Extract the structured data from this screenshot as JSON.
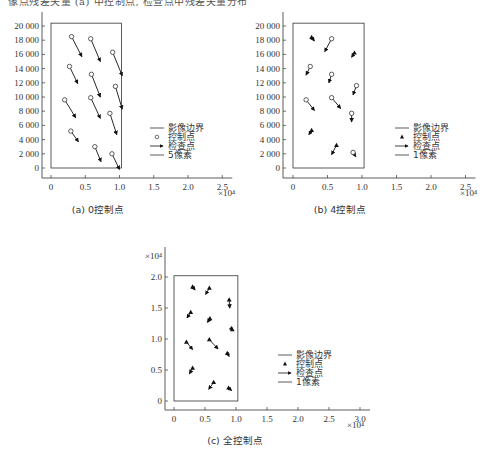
{
  "header_fragment": "像点残差矢量 (a) 中控制点, 检查点中残差矢量分布",
  "charts": [
    {
      "caption": "(a) 0控制点",
      "y_ticks": [
        "20 000",
        "18 000",
        "16 000",
        "14 000",
        "12 000",
        "10 000",
        "8 000",
        "6 000",
        "4 000",
        "2 000",
        "0"
      ],
      "x_ticks": [
        "0",
        "0.5",
        "1.0",
        "1.5",
        "2.0",
        "2.5"
      ],
      "x_scale_label": "×10⁴",
      "legend": [
        "影像边界",
        "控制点",
        "检查点",
        "5像素"
      ]
    },
    {
      "caption": "(b) 4控制点",
      "y_ticks": [
        "20 000",
        "18 000",
        "16 000",
        "14 000",
        "12 000",
        "10 000",
        "8 000",
        "6 000",
        "4 000",
        "2 000",
        "0"
      ],
      "x_ticks": [
        "0",
        "0.5",
        "1.0",
        "1.5",
        "2.0",
        "2.5"
      ],
      "x_scale_label": "×10⁴",
      "legend": [
        "影像边界",
        "控制点",
        "检查点",
        "1像素"
      ]
    },
    {
      "caption": "(c) 全控制点",
      "y_scale_label": "×10⁴",
      "y_ticks": [
        "2.0",
        "1.5",
        "1.0",
        "0.5",
        "0"
      ],
      "x_ticks": [
        "0",
        "0.5",
        "1.0",
        "1.5",
        "2.0",
        "2.5",
        "3.0"
      ],
      "x_scale_label": "×10⁴",
      "legend": [
        "影像边界",
        "控制点",
        "检查点",
        "1像素"
      ]
    }
  ],
  "chart_data": [
    {
      "type": "scatter",
      "title": "(a) 0控制点",
      "xlabel": "×10⁴",
      "ylabel": "",
      "xlim": [
        0,
        2.7
      ],
      "ylim": [
        0,
        20000
      ],
      "image_boundary": {
        "x": [
          0,
          1.03
        ],
        "y": [
          0,
          20400
        ]
      },
      "legend": [
        "影像边界",
        "控制点",
        "检查点",
        "5像素"
      ],
      "points": [
        {
          "x": 0.3,
          "y": 18500,
          "dx": 0.15,
          "dy": -2800,
          "kind": "check"
        },
        {
          "x": 0.58,
          "y": 18200,
          "dx": 0.14,
          "dy": -3200,
          "kind": "check"
        },
        {
          "x": 0.9,
          "y": 16300,
          "dx": 0.14,
          "dy": -3300,
          "kind": "check"
        },
        {
          "x": 0.27,
          "y": 14300,
          "dx": 0.12,
          "dy": -2400,
          "kind": "check"
        },
        {
          "x": 0.59,
          "y": 13200,
          "dx": 0.13,
          "dy": -3200,
          "kind": "check"
        },
        {
          "x": 0.94,
          "y": 11500,
          "dx": 0.1,
          "dy": -3200,
          "kind": "check"
        },
        {
          "x": 0.2,
          "y": 9600,
          "dx": 0.16,
          "dy": -2500,
          "kind": "check"
        },
        {
          "x": 0.58,
          "y": 9900,
          "dx": 0.14,
          "dy": -2900,
          "kind": "check"
        },
        {
          "x": 0.86,
          "y": 7700,
          "dx": 0.1,
          "dy": -3000,
          "kind": "check"
        },
        {
          "x": 0.29,
          "y": 5200,
          "dx": 0.11,
          "dy": -1500,
          "kind": "check"
        },
        {
          "x": 0.64,
          "y": 3000,
          "dx": 0.09,
          "dy": -2100,
          "kind": "check"
        },
        {
          "x": 0.89,
          "y": 2000,
          "dx": 0.11,
          "dy": -2200,
          "kind": "check"
        }
      ]
    },
    {
      "type": "scatter",
      "title": "(b) 4控制点",
      "xlabel": "×10⁴",
      "ylabel": "",
      "xlim": [
        0,
        2.7
      ],
      "ylim": [
        0,
        20000
      ],
      "image_boundary": {
        "x": [
          0,
          1.03
        ],
        "y": [
          0,
          20400
        ]
      },
      "legend": [
        "影像边界",
        "控制点",
        "检查点",
        "1像素"
      ],
      "control_points": [
        {
          "x": 0.27,
          "y": 18400
        },
        {
          "x": 0.89,
          "y": 16200
        },
        {
          "x": 0.27,
          "y": 5300
        },
        {
          "x": 0.63,
          "y": 3200
        }
      ],
      "points": [
        {
          "x": 0.27,
          "y": 18400,
          "dx": 0.04,
          "dy": -500,
          "kind": "control"
        },
        {
          "x": 0.56,
          "y": 18200,
          "dx": -0.1,
          "dy": -1800,
          "kind": "check"
        },
        {
          "x": 0.89,
          "y": 16200,
          "dx": -0.04,
          "dy": -600,
          "kind": "control"
        },
        {
          "x": 0.25,
          "y": 14300,
          "dx": -0.06,
          "dy": -1200,
          "kind": "check"
        },
        {
          "x": 0.56,
          "y": 13200,
          "dx": -0.04,
          "dy": -1200,
          "kind": "check"
        },
        {
          "x": 0.92,
          "y": 11600,
          "dx": -0.05,
          "dy": -1300,
          "kind": "check"
        },
        {
          "x": 0.19,
          "y": 9600,
          "dx": 0.12,
          "dy": -1500,
          "kind": "check"
        },
        {
          "x": 0.56,
          "y": 9900,
          "dx": 0.13,
          "dy": -1500,
          "kind": "check"
        },
        {
          "x": 0.85,
          "y": 7700,
          "dx": 0.0,
          "dy": -1200,
          "kind": "check"
        },
        {
          "x": 0.27,
          "y": 5300,
          "dx": -0.04,
          "dy": -600,
          "kind": "control"
        },
        {
          "x": 0.63,
          "y": 3200,
          "dx": -0.07,
          "dy": -1300,
          "kind": "control"
        },
        {
          "x": 0.87,
          "y": 2200,
          "dx": 0.04,
          "dy": -600,
          "kind": "check"
        }
      ]
    },
    {
      "type": "scatter",
      "title": "(c) 全控制点",
      "xlabel": "×10⁴",
      "ylabel": "×10⁴",
      "xlim": [
        0,
        3.0
      ],
      "ylim": [
        0,
        2.0
      ],
      "image_boundary": {
        "x": [
          0,
          1.03
        ],
        "y": [
          0,
          2.02
        ]
      },
      "legend": [
        "影像边界",
        "控制点",
        "检查点",
        "1像素"
      ],
      "points": [
        {
          "x": 0.3,
          "y": 1.84,
          "dx": 0.04,
          "dy": -0.05,
          "kind": "control"
        },
        {
          "x": 0.57,
          "y": 1.82,
          "dx": -0.06,
          "dy": -0.1,
          "kind": "control"
        },
        {
          "x": 0.89,
          "y": 1.63,
          "dx": 0.01,
          "dy": -0.13,
          "kind": "control"
        },
        {
          "x": 0.27,
          "y": 1.43,
          "dx": -0.06,
          "dy": -0.09,
          "kind": "control"
        },
        {
          "x": 0.58,
          "y": 1.33,
          "dx": -0.04,
          "dy": -0.06,
          "kind": "control"
        },
        {
          "x": 0.94,
          "y": 1.15,
          "dx": 0.01,
          "dy": -0.01,
          "kind": "control"
        },
        {
          "x": 0.2,
          "y": 0.95,
          "dx": 0.1,
          "dy": -0.12,
          "kind": "control"
        },
        {
          "x": 0.57,
          "y": 0.99,
          "dx": 0.14,
          "dy": -0.15,
          "kind": "control"
        },
        {
          "x": 0.86,
          "y": 0.77,
          "dx": 0.03,
          "dy": -0.05,
          "kind": "control"
        },
        {
          "x": 0.3,
          "y": 0.53,
          "dx": -0.05,
          "dy": -0.09,
          "kind": "control"
        },
        {
          "x": 0.64,
          "y": 0.3,
          "dx": -0.08,
          "dy": -0.11,
          "kind": "control"
        },
        {
          "x": 0.88,
          "y": 0.21,
          "dx": 0.05,
          "dy": -0.04,
          "kind": "control"
        }
      ]
    }
  ]
}
